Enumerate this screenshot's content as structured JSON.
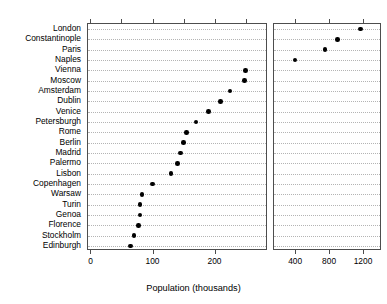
{
  "chart_data": {
    "type": "scatter",
    "subtype": "cleveland-dot-plot",
    "title": "",
    "xlabel": "Population (thousands)",
    "ylabel": "",
    "grid": true,
    "legend": null,
    "orientation": "horizontal",
    "categories": [
      "London",
      "Constantinople",
      "Paris",
      "Naples",
      "Vienna",
      "Moscow",
      "Amsterdam",
      "Dublin",
      "Venice",
      "Petersburgh",
      "Rome",
      "Berlin",
      "Madrid",
      "Palermo",
      "Lisbon",
      "Copenhagen",
      "Warsaw",
      "Turin",
      "Genoa",
      "Florence",
      "Stockholm",
      "Edinburgh"
    ],
    "values": [
      1170,
      900,
      750,
      400,
      250,
      248,
      225,
      210,
      190,
      170,
      155,
      150,
      145,
      140,
      130,
      100,
      83,
      80,
      80,
      77,
      70,
      65
    ],
    "panels": [
      {
        "name": "left-panel",
        "xlim": [
          -4,
          283
        ],
        "ticks": [
          0,
          100,
          200
        ],
        "tick_labels": [
          "0",
          "100",
          "200"
        ],
        "categories": [
          "Vienna",
          "Moscow",
          "Amsterdam",
          "Dublin",
          "Venice",
          "Petersburgh",
          "Rome",
          "Berlin",
          "Madrid",
          "Palermo",
          "Lisbon",
          "Copenhagen",
          "Warsaw",
          "Turin",
          "Genoa",
          "Florence",
          "Stockholm",
          "Edinburgh"
        ],
        "values": [
          250,
          248,
          225,
          210,
          190,
          170,
          155,
          150,
          145,
          140,
          130,
          100,
          83,
          80,
          80,
          77,
          70,
          65
        ]
      },
      {
        "name": "right-panel",
        "xlim": [
          150,
          1400
        ],
        "ticks": [
          400,
          800,
          1200
        ],
        "tick_labels": [
          "400",
          "800",
          "1200"
        ],
        "categories": [
          "London",
          "Constantinople",
          "Paris",
          "Naples"
        ],
        "values": [
          1170,
          900,
          750,
          400
        ]
      }
    ],
    "colors": {
      "point": "#000000",
      "gridline": "#b4b4b4",
      "panel_border": "#4d4d4d",
      "background": "#ffffff",
      "text": "#000000"
    }
  },
  "axis": {
    "x_title": "Population (thousands)",
    "left_tick_labels": [
      "0",
      "100",
      "200"
    ],
    "right_tick_labels": [
      "400",
      "800",
      "1200"
    ]
  }
}
